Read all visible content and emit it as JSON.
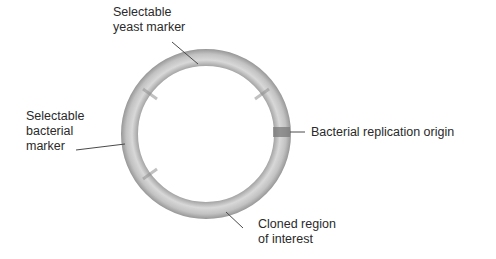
{
  "diagram": {
    "type": "plasmid-map",
    "colors": {
      "ring": "#b8b8b8",
      "ring_dark": "#8a8a8a",
      "ring_light": "#d4d4d4",
      "origin_band": "#7a7a7a",
      "leader": "#4a4a4a",
      "text": "#2a2a2a"
    },
    "labels": {
      "yeast_marker": {
        "line1": "Selectable",
        "line2": "yeast marker"
      },
      "bacterial_marker": {
        "line1": "Selectable",
        "line2": "bacterial",
        "line3": "marker"
      },
      "replication_origin": {
        "line1": "Bacterial replication origin"
      },
      "cloned_region": {
        "line1": "Cloned region",
        "line2": "of interest"
      }
    }
  }
}
